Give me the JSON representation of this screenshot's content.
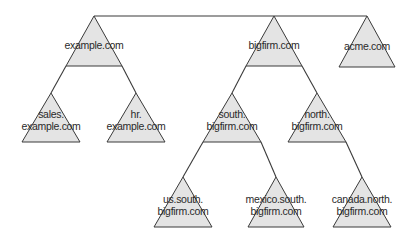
{
  "diagram": {
    "type": "domain-tree",
    "colors": {
      "fill": "#e4e4e4",
      "stroke": "#3a3a3a",
      "text": "#2a2a2a"
    },
    "nodes": [
      {
        "id": "example",
        "lines": [
          "example.com"
        ],
        "apex": [
          94,
          16
        ],
        "base_y": 66,
        "half_width": 28
      },
      {
        "id": "bigfirm",
        "lines": [
          "bigfirm.com"
        ],
        "apex": [
          274,
          16
        ],
        "base_y": 66,
        "half_width": 28
      },
      {
        "id": "acme",
        "lines": [
          "acme.com"
        ],
        "apex": [
          367,
          16
        ],
        "base_y": 67,
        "half_width": 28
      },
      {
        "id": "sales",
        "lines": [
          "sales.",
          "example.com"
        ],
        "apex": [
          51,
          93
        ],
        "base_y": 142,
        "half_width": 29
      },
      {
        "id": "hr",
        "lines": [
          "hr.",
          "example.com"
        ],
        "apex": [
          136,
          93
        ],
        "base_y": 142,
        "half_width": 29
      },
      {
        "id": "south",
        "lines": [
          "south.",
          "bigfirm.com"
        ],
        "apex": [
          232,
          93
        ],
        "base_y": 142,
        "half_width": 29
      },
      {
        "id": "north",
        "lines": [
          "north.",
          "bigfirm.com"
        ],
        "apex": [
          317,
          93
        ],
        "base_y": 142,
        "half_width": 29
      },
      {
        "id": "us_south",
        "lines": [
          "us.south.",
          "bigfirm.com"
        ],
        "apex": [
          183,
          177
        ],
        "base_y": 227,
        "half_width": 29
      },
      {
        "id": "mexico_south",
        "lines": [
          "mexico.south.",
          "bigfirm.com"
        ],
        "apex": [
          276,
          177
        ],
        "base_y": 227,
        "half_width": 28
      },
      {
        "id": "canada_north",
        "lines": [
          "canada.north.",
          "bigfirm.com"
        ],
        "apex": [
          362,
          177
        ],
        "base_y": 227,
        "half_width": 29
      }
    ],
    "forest_link": {
      "from": "example",
      "to": "acme",
      "y": 16
    },
    "edges": [
      {
        "parent": "example",
        "child": "sales",
        "side": "left"
      },
      {
        "parent": "example",
        "child": "hr",
        "side": "right"
      },
      {
        "parent": "bigfirm",
        "child": "south",
        "side": "left"
      },
      {
        "parent": "bigfirm",
        "child": "north",
        "side": "right"
      },
      {
        "parent": "south",
        "child": "us_south",
        "side": "left"
      },
      {
        "parent": "south",
        "child": "mexico_south",
        "side": "right"
      },
      {
        "parent": "north",
        "child": "canada_north",
        "side": "right"
      }
    ]
  }
}
